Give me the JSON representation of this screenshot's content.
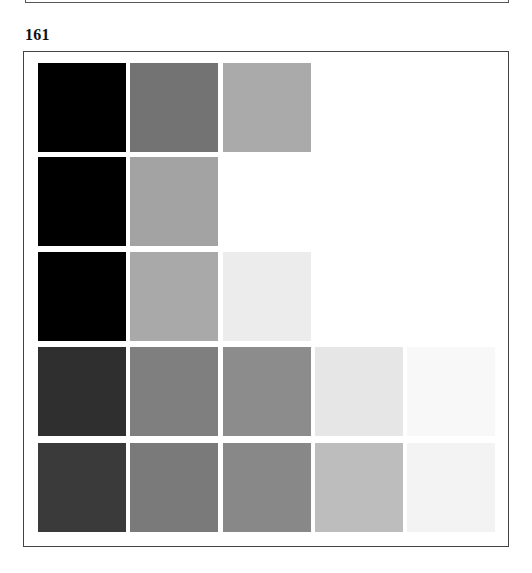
{
  "previous_figure": {
    "visible": true
  },
  "figure": {
    "number": "161",
    "grid": {
      "column_x": [
        38,
        130,
        223,
        315,
        407
      ],
      "row_y": [
        63,
        157,
        252,
        347,
        443
      ],
      "rows": [
        {
          "row": 1,
          "swatches": [
            "#000000",
            "#737373",
            "#aaaaaa"
          ]
        },
        {
          "row": 2,
          "swatches": [
            "#000000",
            "#a3a3a3"
          ]
        },
        {
          "row": 3,
          "swatches": [
            "#000000",
            "#a9a9a9",
            "#ececec"
          ]
        },
        {
          "row": 4,
          "swatches": [
            "#2f2f2f",
            "#7f7f7f",
            "#8c8c8c",
            "#e6e6e6",
            "#f8f8f8"
          ]
        },
        {
          "row": 5,
          "swatches": [
            "#3a3a3a",
            "#7a7a7a",
            "#888888",
            "#bdbdbd",
            "#f3f3f3"
          ]
        }
      ]
    }
  }
}
